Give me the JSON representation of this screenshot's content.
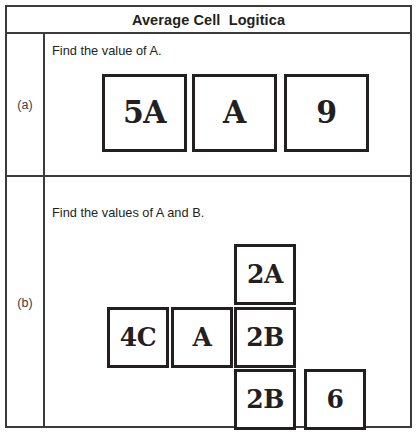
{
  "worksheet": {
    "title": "Average Cell  Logitica",
    "rows": [
      {
        "label": "(a)",
        "prompt": "Find the value of A.",
        "cells": [
          {
            "text": "5A"
          },
          {
            "text": "A"
          },
          {
            "text": "9"
          }
        ]
      },
      {
        "label": "(b)",
        "prompt": "Find the values of A and B.",
        "cells": [
          {
            "text": "2A"
          },
          {
            "text": "4C"
          },
          {
            "text": "A"
          },
          {
            "text": "2B"
          },
          {
            "text": "2B"
          },
          {
            "text": "6"
          }
        ]
      }
    ]
  },
  "colors": {
    "border": "#3b3b3b",
    "box_border": "#231f20",
    "text": "#231f20",
    "background": "#ffffff"
  }
}
